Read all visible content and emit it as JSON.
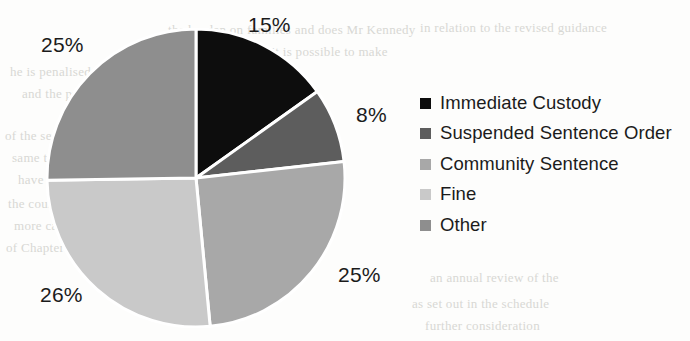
{
  "chart_data": {
    "type": "pie",
    "title": "",
    "categories": [
      "Immediate Custody",
      "Suspended Sentence Order",
      "Community Sentence",
      "Fine",
      "Other"
    ],
    "values": [
      15,
      8,
      25,
      26,
      25
    ],
    "value_labels": [
      "15%",
      "8%",
      "25%",
      "26%",
      "25%"
    ],
    "colors": [
      "#0d0d0d",
      "#5d5d5d",
      "#a8a8a8",
      "#c9c9c9",
      "#8e8e8e"
    ],
    "start_angle_deg": 0,
    "direction": "clockwise",
    "legend_position": "right",
    "grid": false,
    "separator_color": "#ffffff"
  },
  "legend": {
    "items": [
      {
        "label": "Immediate Custody",
        "color": "#0d0d0d"
      },
      {
        "label": "Suspended Sentence Order",
        "color": "#5d5d5d"
      },
      {
        "label": "Community Sentence",
        "color": "#a8a8a8"
      },
      {
        "label": "Fine",
        "color": "#c9c9c9"
      },
      {
        "label": "Other",
        "color": "#8e8e8e"
      }
    ]
  },
  "slice_labels": [
    {
      "text": "15%",
      "left": 248,
      "top": 13
    },
    {
      "text": "8%",
      "left": 356,
      "top": 103
    },
    {
      "text": "25%",
      "left": 338,
      "top": 263
    },
    {
      "text": "26%",
      "left": 40,
      "top": 283
    },
    {
      "text": "25%",
      "left": 41,
      "top": 33
    }
  ],
  "background_bleed": [
    {
      "text": "the burden on families and does Mr Kennedy",
      "left": 168,
      "top": 22
    },
    {
      "text": "acknowledge it is possible to make",
      "left": 196,
      "top": 44
    },
    {
      "text": "he is penalised under the present system",
      "left": 10,
      "top": 64
    },
    {
      "text": "and the problems that arise in",
      "left": 22,
      "top": 86
    },
    {
      "text": "of the sentence. I am able to",
      "left": 5,
      "top": 128
    },
    {
      "text": "same to move from a community",
      "left": 12,
      "top": 150
    },
    {
      "text": "have operated for a sentence",
      "left": 18,
      "top": 172
    },
    {
      "text": "the court is handling and involve a starting point",
      "left": 8,
      "top": 196
    },
    {
      "text": "more cases requires the attention",
      "left": 14,
      "top": 218
    },
    {
      "text": "of Chapter 4 and if it is not the case",
      "left": 6,
      "top": 240
    },
    {
      "text": "in relation to the revised guidance",
      "left": 420,
      "top": 20
    },
    {
      "text": "an annual review of the",
      "left": 430,
      "top": 270
    },
    {
      "text": "as set out in the schedule",
      "left": 412,
      "top": 296
    },
    {
      "text": "further consideration",
      "left": 425,
      "top": 318
    }
  ]
}
